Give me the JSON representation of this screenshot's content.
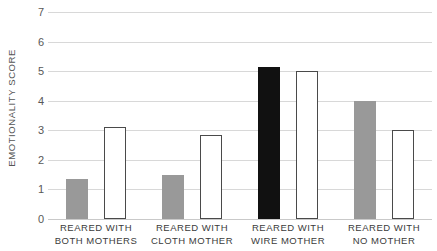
{
  "chart_data": {
    "type": "bar",
    "title": "",
    "xlabel": "",
    "ylabel": "EMOTIONALITY SCORE",
    "ylim": [
      0,
      7
    ],
    "yticks": [
      0,
      1,
      2,
      3,
      4,
      5,
      6,
      7
    ],
    "ytick_labels": [
      "0",
      "1",
      "2",
      "3",
      "4",
      "5",
      "6",
      "7"
    ],
    "grid": true,
    "legend": "none",
    "categories": [
      "REARED WITH BOTH MOTHERS",
      "REARED WITH CLOTH MOTHER",
      "REARED WITH WIRE MOTHER",
      "REARED WITH NO MOTHER"
    ],
    "category_lines": [
      {
        "line1": "REARED WITH",
        "line2": "BOTH MOTHERS"
      },
      {
        "line1": "REARED WITH",
        "line2": "CLOTH MOTHER"
      },
      {
        "line1": "REARED WITH",
        "line2": "WIRE MOTHER"
      },
      {
        "line1": "REARED WITH",
        "line2": "NO MOTHER"
      }
    ],
    "series": [
      {
        "name": "first-bar",
        "values": [
          1.35,
          1.5,
          5.15,
          4.0
        ],
        "styles": [
          "filled-gray",
          "filled-gray",
          "filled-black",
          "filled-gray"
        ]
      },
      {
        "name": "second-bar",
        "values": [
          3.1,
          2.85,
          5.0,
          3.0
        ],
        "styles": [
          "outline",
          "outline",
          "outline",
          "outline"
        ]
      }
    ],
    "colors": {
      "gray_fill": "#999999",
      "black_fill": "#111111",
      "outline_fill": "#ffffff",
      "outline_stroke": "#4a4a4a",
      "gridline": "#d8d8d8",
      "baseline": "#c9c9c9",
      "tick_text": "#585858",
      "axis_title_text": "#555555",
      "category_text": "#3b3b3b",
      "background": "#ffffff"
    }
  }
}
